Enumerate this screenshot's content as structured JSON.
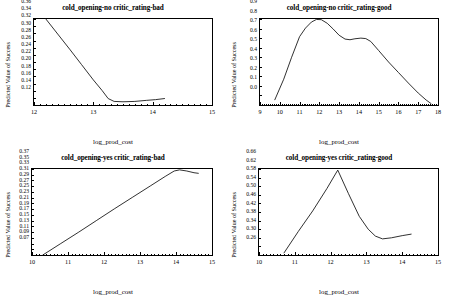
{
  "figure": {
    "panel_count": 4,
    "axis_label_x": "log_prod_cost",
    "axis_label_y": "Predicted Value of Success"
  },
  "chart_data": [
    {
      "type": "line",
      "title": "cold_opening-no critic_rating-bad",
      "xlabel": "log_prod_cost",
      "ylabel": "Predicted Value of Success",
      "xlim": [
        12,
        15
      ],
      "ylim": [
        0.12,
        0.36
      ],
      "xticks": [
        12,
        13,
        14,
        15
      ],
      "yticks": [
        0.12,
        0.14,
        0.16,
        0.18,
        0.2,
        0.22,
        0.24,
        0.26,
        0.28,
        0.3,
        0.32,
        0.34,
        0.36
      ],
      "ytick_labels": [
        "0.12",
        "0.14",
        "0.16",
        "0.18",
        "0.20",
        "0.22",
        "0.24",
        "0.26",
        "0.28",
        "0.30",
        "0.32",
        "0.34",
        "0.36"
      ],
      "xtick_labels": [
        "12",
        "13",
        "14",
        "15"
      ],
      "grid": false,
      "legend": "none",
      "x": [
        12.2,
        12.4,
        12.6,
        12.8,
        13.0,
        13.15,
        13.25,
        13.35,
        13.5,
        13.7,
        13.9,
        14.05,
        14.2
      ],
      "y": [
        0.36,
        0.318,
        0.276,
        0.233,
        0.19,
        0.16,
        0.138,
        0.13,
        0.129,
        0.13,
        0.133,
        0.135,
        0.138
      ]
    },
    {
      "type": "line",
      "title": "cold_opening-no critic_rating-good",
      "xlabel": "log_prod_cost",
      "ylabel": "Predicted Value of Success",
      "xlim": [
        9,
        18
      ],
      "ylim": [
        0.0,
        0.9
      ],
      "xticks": [
        9,
        10,
        11,
        12,
        13,
        14,
        15,
        16,
        17,
        18
      ],
      "yticks": [
        0.0,
        0.1,
        0.2,
        0.3,
        0.4,
        0.5,
        0.6,
        0.7,
        0.8,
        0.9
      ],
      "ytick_labels": [
        "0.0",
        "0.1",
        "0.2",
        "0.3",
        "0.4",
        "0.5",
        "0.6",
        "0.7",
        "0.8",
        "0.9"
      ],
      "xtick_labels": [
        "9",
        "10",
        "11",
        "12",
        "13",
        "14",
        "15",
        "16",
        "17",
        "18"
      ],
      "grid": false,
      "legend": "none",
      "x": [
        9.75,
        10.2,
        10.6,
        11.0,
        11.3,
        11.6,
        11.85,
        12.1,
        12.4,
        12.7,
        13.0,
        13.3,
        13.55,
        13.8,
        14.1,
        14.35,
        14.6,
        15.0,
        15.5,
        16.0,
        16.5,
        17.0,
        17.4,
        17.65
      ],
      "y": [
        0.055,
        0.27,
        0.5,
        0.715,
        0.805,
        0.868,
        0.895,
        0.893,
        0.855,
        0.795,
        0.73,
        0.69,
        0.683,
        0.693,
        0.7,
        0.695,
        0.665,
        0.57,
        0.45,
        0.34,
        0.23,
        0.125,
        0.052,
        0.015
      ]
    },
    {
      "type": "line",
      "title": "cold_opening-yes critic_rating-bad",
      "xlabel": "log_prod_cost",
      "ylabel": "Predicted Value of Success",
      "xlim": [
        10,
        15
      ],
      "ylim": [
        0.07,
        0.37
      ],
      "xticks": [
        10,
        11,
        12,
        13,
        14,
        15
      ],
      "yticks": [
        0.07,
        0.09,
        0.11,
        0.13,
        0.15,
        0.17,
        0.19,
        0.21,
        0.23,
        0.25,
        0.27,
        0.29,
        0.31,
        0.33,
        0.35,
        0.37
      ],
      "ytick_labels": [
        "0.07",
        "0.09",
        "0.11",
        "0.13",
        "0.15",
        "0.17",
        "0.19",
        "0.21",
        "0.23",
        "0.25",
        "0.27",
        "0.29",
        "0.31",
        "0.33",
        "0.35",
        "0.37"
      ],
      "xtick_labels": [
        "10",
        "11",
        "12",
        "13",
        "14",
        "15"
      ],
      "grid": false,
      "legend": "none",
      "x": [
        10.3,
        10.8,
        11.3,
        11.8,
        12.3,
        12.8,
        13.3,
        13.7,
        13.95,
        14.1,
        14.3,
        14.5,
        14.62
      ],
      "y": [
        0.07,
        0.11,
        0.15,
        0.191,
        0.232,
        0.272,
        0.312,
        0.344,
        0.363,
        0.367,
        0.363,
        0.357,
        0.355
      ]
    },
    {
      "type": "line",
      "title": "cold_opening-yes critic_rating-good",
      "xlabel": "log_prod_cost",
      "ylabel": "Predicted Value of Success",
      "xlim": [
        10,
        15
      ],
      "ylim": [
        0.26,
        0.66
      ],
      "xticks": [
        10,
        11,
        12,
        13,
        14,
        15
      ],
      "yticks": [
        0.26,
        0.3,
        0.34,
        0.38,
        0.42,
        0.46,
        0.5,
        0.54,
        0.58,
        0.62,
        0.66
      ],
      "ytick_labels": [
        "0.26",
        "0.30",
        "0.34",
        "0.38",
        "0.42",
        "0.46",
        "0.50",
        "0.54",
        "0.58",
        "0.62",
        "0.66"
      ],
      "xtick_labels": [
        "10",
        "11",
        "12",
        "13",
        "14",
        "15"
      ],
      "grid": false,
      "legend": "none",
      "x": [
        10.7,
        11.1,
        11.5,
        11.9,
        12.2,
        12.5,
        12.8,
        13.05,
        13.25,
        13.45,
        13.7,
        14.0,
        14.25
      ],
      "y": [
        0.27,
        0.37,
        0.465,
        0.57,
        0.655,
        0.545,
        0.44,
        0.38,
        0.348,
        0.335,
        0.34,
        0.35,
        0.357
      ]
    }
  ]
}
